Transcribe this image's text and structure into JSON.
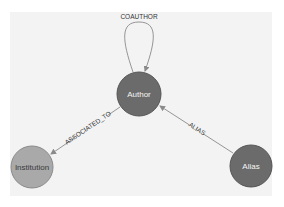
{
  "diagram": {
    "type": "graph-schema",
    "nodes": [
      {
        "id": "author",
        "label": "Author",
        "color": "#6b6b6b",
        "text_color": "#f5f5f5"
      },
      {
        "id": "institution",
        "label": "Institution",
        "color": "#a9a9a9",
        "text_color": "#3a3a3a"
      },
      {
        "id": "alias",
        "label": "Alias",
        "color": "#6b6b6b",
        "text_color": "#f5f5f5"
      }
    ],
    "edges": [
      {
        "id": "coauthor",
        "label": "COAUTHOR",
        "from": "author",
        "to": "author"
      },
      {
        "id": "associated_to",
        "label": "ASSOCIATED_TO",
        "from": "author",
        "to": "institution"
      },
      {
        "id": "alias",
        "label": "ALIAS",
        "from": "alias",
        "to": "author"
      }
    ],
    "colors": {
      "panel_background": "#f3f3f3",
      "edge": "#8a8a8a",
      "node_border": "#555555"
    }
  }
}
